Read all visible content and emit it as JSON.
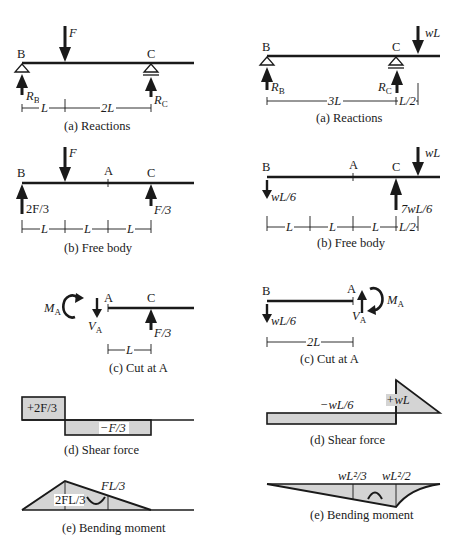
{
  "colors": {
    "line": "#1a1a1a",
    "fill": "#d4d4d4",
    "background": "#ffffff"
  },
  "left": {
    "reactions": {
      "caption": "(a) Reactions",
      "point_b": "B",
      "point_c": "C",
      "load": "F",
      "reaction_b": "R",
      "reaction_b_sub": "B",
      "reaction_c": "R",
      "reaction_c_sub": "C",
      "dims": [
        "L",
        "2L"
      ]
    },
    "free_body": {
      "caption": "(b) Free body",
      "point_b": "B",
      "point_a": "A",
      "point_c": "C",
      "load": "F",
      "reaction_b": "2F/3",
      "reaction_c": "F/3",
      "dims": [
        "L",
        "L",
        "L"
      ]
    },
    "cut": {
      "caption": "(c) Cut at A",
      "point_a": "A",
      "point_c": "C",
      "moment": "M",
      "moment_sub": "A",
      "shear": "V",
      "shear_sub": "A",
      "reaction_c": "F/3",
      "dims": [
        "L"
      ]
    },
    "shear": {
      "caption": "(d) Shear force",
      "positive_label": "+2F/3",
      "negative_label": "−F/3"
    },
    "moment": {
      "caption": "(e) Bending moment",
      "peak_label": "2FL/3",
      "a_label": "FL/3"
    }
  },
  "right": {
    "reactions": {
      "caption": "(a) Reactions",
      "point_b": "B",
      "point_c": "C",
      "load": "wL",
      "reaction_b": "R",
      "reaction_b_sub": "B",
      "reaction_c": "R",
      "reaction_c_sub": "C",
      "dims": [
        "3L",
        "L/2"
      ]
    },
    "free_body": {
      "caption": "(b) Free body",
      "point_b": "B",
      "point_a": "A",
      "point_c": "C",
      "load": "wL",
      "reaction_b": "wL/6",
      "reaction_c": "7wL/6",
      "dims": [
        "L",
        "L",
        "L",
        "L/2"
      ]
    },
    "cut": {
      "caption": "(c) Cut at A",
      "point_b": "B",
      "point_a": "A",
      "moment": "M",
      "moment_sub": "A",
      "shear": "V",
      "shear_sub": "A",
      "reaction_b": "wL/6",
      "dims": [
        "2L"
      ]
    },
    "shear": {
      "caption": "(d) Shear force",
      "negative_label": "−wL/6",
      "positive_label": "+wL"
    },
    "moment": {
      "caption": "(e) Bending moment",
      "a_label": "wL²/3",
      "c_label": "wL²/2"
    }
  }
}
